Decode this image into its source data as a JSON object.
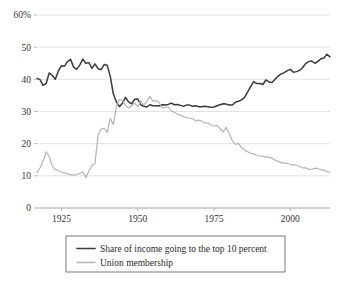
{
  "chart_data": {
    "type": "line",
    "title": "",
    "subtitle": "",
    "xlabel": "",
    "ylabel": "",
    "xlim": [
      1917,
      2013
    ],
    "ylim": [
      0,
      60
    ],
    "grid": true,
    "legend_position": "bottom",
    "y_ticks": [
      0,
      10,
      20,
      30,
      40,
      50,
      60
    ],
    "y_tick_labels": [
      "0",
      "10",
      "20",
      "30",
      "40",
      "50",
      "60%"
    ],
    "x_ticks": [
      1925,
      1950,
      1975,
      2000
    ],
    "x_tick_labels": [
      "1925",
      "1950",
      "1975",
      "2000"
    ],
    "colors": {
      "income_share": "#3a3a3a",
      "union_membership": "#b4b4b4",
      "gridline": "#cfcfcf",
      "axis": "#9a9a9a",
      "background": "#ffffff",
      "text": "#2b2b2b"
    },
    "series": [
      {
        "name": "Share of income going to the top 10 percent",
        "color": "#3a3a3a",
        "x": [
          1917,
          1918,
          1919,
          1920,
          1921,
          1922,
          1923,
          1924,
          1925,
          1926,
          1927,
          1928,
          1929,
          1930,
          1931,
          1932,
          1933,
          1934,
          1935,
          1936,
          1937,
          1938,
          1939,
          1940,
          1941,
          1942,
          1943,
          1944,
          1945,
          1946,
          1947,
          1948,
          1949,
          1950,
          1951,
          1952,
          1953,
          1954,
          1955,
          1956,
          1957,
          1958,
          1959,
          1960,
          1961,
          1962,
          1963,
          1964,
          1965,
          1966,
          1967,
          1968,
          1969,
          1970,
          1971,
          1972,
          1973,
          1974,
          1975,
          1976,
          1977,
          1978,
          1979,
          1980,
          1981,
          1982,
          1983,
          1984,
          1985,
          1986,
          1987,
          1988,
          1989,
          1990,
          1991,
          1992,
          1993,
          1994,
          1995,
          1996,
          1997,
          1998,
          1999,
          2000,
          2001,
          2002,
          2003,
          2004,
          2005,
          2006,
          2007,
          2008,
          2009,
          2010,
          2011,
          2012,
          2013
        ],
        "values": [
          40.3,
          39.9,
          38.1,
          38.7,
          42.0,
          41.2,
          40.0,
          42.6,
          44.2,
          44.1,
          45.5,
          46.2,
          43.8,
          43.1,
          44.4,
          46.3,
          45.0,
          45.2,
          43.4,
          44.8,
          43.3,
          43.0,
          44.6,
          44.4,
          41.0,
          35.5,
          33.0,
          31.5,
          32.6,
          34.4,
          33.0,
          32.4,
          33.8,
          33.9,
          32.1,
          31.6,
          31.4,
          32.1,
          31.8,
          31.8,
          31.7,
          32.1,
          32.0,
          32.2,
          32.6,
          32.1,
          32.2,
          31.9,
          31.6,
          32.0,
          32.0,
          31.6,
          31.8,
          31.5,
          31.5,
          31.6,
          31.5,
          31.3,
          31.4,
          31.8,
          32.1,
          32.4,
          32.3,
          32.0,
          32.0,
          32.9,
          33.2,
          33.6,
          34.4,
          36.0,
          37.7,
          39.3,
          38.7,
          38.7,
          38.4,
          39.8,
          39.2,
          39.0,
          40.0,
          41.0,
          41.7,
          42.1,
          42.7,
          43.1,
          42.2,
          42.4,
          42.8,
          43.6,
          44.9,
          45.5,
          45.7,
          45.0,
          45.5,
          46.4,
          46.6,
          47.8,
          47.0
        ]
      },
      {
        "name": "Union membership",
        "color": "#b4b4b4",
        "x": [
          1917,
          1918,
          1919,
          1920,
          1921,
          1922,
          1923,
          1924,
          1925,
          1926,
          1927,
          1928,
          1929,
          1930,
          1931,
          1932,
          1933,
          1934,
          1935,
          1936,
          1937,
          1938,
          1939,
          1940,
          1941,
          1942,
          1943,
          1944,
          1945,
          1946,
          1947,
          1948,
          1949,
          1950,
          1951,
          1952,
          1953,
          1954,
          1955,
          1956,
          1957,
          1958,
          1959,
          1960,
          1961,
          1962,
          1963,
          1964,
          1965,
          1966,
          1967,
          1968,
          1969,
          1970,
          1971,
          1972,
          1973,
          1974,
          1975,
          1976,
          1977,
          1978,
          1979,
          1980,
          1981,
          1982,
          1983,
          1984,
          1985,
          1986,
          1987,
          1988,
          1989,
          1990,
          1991,
          1992,
          1993,
          1994,
          1995,
          1996,
          1997,
          1998,
          1999,
          2000,
          2001,
          2002,
          2003,
          2004,
          2005,
          2006,
          2007,
          2008,
          2009,
          2010,
          2011,
          2012,
          2013
        ],
        "values": [
          11.0,
          12.5,
          14.5,
          17.5,
          16.0,
          13.0,
          12.0,
          11.6,
          11.2,
          10.9,
          10.6,
          10.4,
          10.2,
          10.4,
          10.7,
          11.2,
          9.5,
          11.5,
          13.2,
          13.8,
          22.6,
          24.5,
          24.8,
          23.5,
          27.9,
          25.9,
          31.4,
          33.8,
          33.4,
          31.9,
          31.1,
          31.8,
          32.6,
          31.5,
          33.3,
          32.0,
          33.2,
          34.7,
          33.2,
          33.4,
          32.8,
          31.1,
          31.3,
          31.4,
          30.2,
          29.8,
          29.1,
          28.9,
          28.4,
          28.1,
          27.9,
          27.8,
          27.0,
          27.3,
          27.0,
          26.4,
          26.5,
          25.8,
          25.5,
          25.7,
          24.7,
          23.6,
          25.1,
          23.2,
          20.9,
          19.8,
          20.1,
          18.8,
          18.0,
          17.5,
          17.0,
          16.8,
          16.4,
          16.1,
          16.1,
          15.8,
          15.8,
          15.5,
          14.9,
          14.5,
          14.1,
          13.9,
          13.9,
          13.5,
          13.5,
          13.3,
          12.9,
          12.5,
          12.5,
          12.0,
          12.1,
          12.4,
          12.3,
          11.9,
          11.8,
          11.3,
          11.2
        ]
      }
    ]
  },
  "legend": {
    "entries": [
      {
        "label": "Share of income going to the top 10 percent",
        "color": "#3a3a3a"
      },
      {
        "label": "Union membership",
        "color": "#b4b4b4"
      }
    ]
  }
}
